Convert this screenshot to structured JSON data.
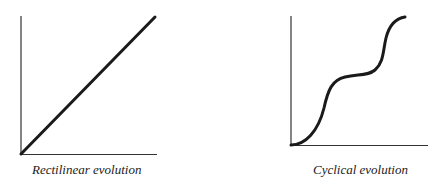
{
  "diagrams": [
    {
      "caption": "Rectilinear evolution",
      "type": "line",
      "shape": "straight diagonal"
    },
    {
      "caption": "Cyclical evolution",
      "type": "line",
      "shape": "stepped S-curve with plateaus"
    }
  ],
  "colors": {
    "line": "#1a1a1a",
    "axis": "#333333",
    "background": "#ffffff"
  }
}
